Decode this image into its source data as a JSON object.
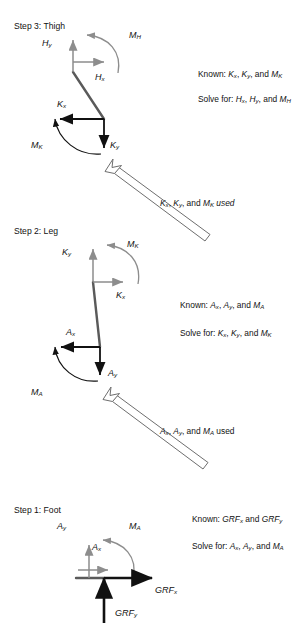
{
  "figure": {
    "title": "Inverse dynamics solution sequence: foot, leg, thigh free-body diagrams",
    "background": "#ffffff",
    "segment_color": "#555555",
    "arrow_dark": "#111111",
    "arrow_gray": "#8d8d8d",
    "hollow_arrow_stroke": "#6e6e6e"
  },
  "steps": [
    {
      "id": "step3",
      "title": "Step 3: Thigh",
      "known_label": "Known:",
      "known_terms": [
        {
          "base": "K",
          "sub": "x"
        },
        {
          "base": "K",
          "sub": "y"
        },
        {
          "base": "M",
          "sub": "K"
        }
      ],
      "known_text": "Known: Kx, Ky, and MK",
      "solve_label": "Solve for:",
      "solve_terms": [
        {
          "base": "H",
          "sub": "x"
        },
        {
          "base": "H",
          "sub": "y"
        },
        {
          "base": "M",
          "sub": "H"
        }
      ],
      "solve_text": "Solve for: Hx, Hy, and MH",
      "vectors": [
        {
          "name": "Hy",
          "base": "H",
          "sub": "y"
        },
        {
          "name": "Hx",
          "base": "H",
          "sub": "x"
        },
        {
          "name": "MH",
          "base": "M",
          "sub": "H"
        },
        {
          "name": "Kx",
          "base": "K",
          "sub": "x"
        },
        {
          "name": "Ky",
          "base": "K",
          "sub": "y"
        },
        {
          "name": "MK",
          "base": "M",
          "sub": "K"
        }
      ]
    },
    {
      "id": "step2",
      "title": "Step 2: Leg",
      "known_label": "Known:",
      "known_terms": [
        {
          "base": "A",
          "sub": "x"
        },
        {
          "base": "A",
          "sub": "y"
        },
        {
          "base": "M",
          "sub": "A"
        }
      ],
      "known_text": "Known: Ax, Ay, and MA",
      "solve_label": "Solve for:",
      "solve_terms": [
        {
          "base": "K",
          "sub": "x"
        },
        {
          "base": "K",
          "sub": "y"
        },
        {
          "base": "M",
          "sub": "K"
        }
      ],
      "solve_text": "Solve for: Kx, Ky, and MK",
      "vectors": [
        {
          "name": "Ky",
          "base": "K",
          "sub": "y"
        },
        {
          "name": "Kx",
          "base": "K",
          "sub": "x"
        },
        {
          "name": "MK",
          "base": "M",
          "sub": "K"
        },
        {
          "name": "Ax",
          "base": "A",
          "sub": "x"
        },
        {
          "name": "Ay",
          "base": "A",
          "sub": "y"
        },
        {
          "name": "MA",
          "base": "M",
          "sub": "A"
        }
      ]
    },
    {
      "id": "step1",
      "title": "Step 1: Foot",
      "known_label": "Known:",
      "known_terms": [
        {
          "base": "GRF",
          "sub": "x"
        },
        {
          "base": "GRF",
          "sub": "y"
        }
      ],
      "known_text": "Known: GRFx and GRFy",
      "solve_label": "Solve for:",
      "solve_terms": [
        {
          "base": "A",
          "sub": "x"
        },
        {
          "base": "A",
          "sub": "y"
        },
        {
          "base": "M",
          "sub": "A"
        }
      ],
      "solve_text": "Solve for: Ax, Ay, and MA",
      "vectors": [
        {
          "name": "Ay",
          "base": "A",
          "sub": "y"
        },
        {
          "name": "Ax",
          "base": "A",
          "sub": "x"
        },
        {
          "name": "MA",
          "base": "M",
          "sub": "A"
        },
        {
          "name": "GRFx",
          "base": "GRF",
          "sub": "x"
        },
        {
          "name": "GRFy",
          "base": "GRF",
          "sub": "y"
        }
      ]
    }
  ],
  "transfers": [
    {
      "id": "transfer-leg-to-thigh",
      "terms": [
        {
          "base": "K",
          "sub": "x"
        },
        {
          "base": "K",
          "sub": "y"
        },
        {
          "base": "M",
          "sub": "K"
        }
      ],
      "suffix": "used",
      "text": "Kx, Ky, and MK used"
    },
    {
      "id": "transfer-foot-to-leg",
      "terms": [
        {
          "base": "A",
          "sub": "x"
        },
        {
          "base": "A",
          "sub": "y"
        },
        {
          "base": "M",
          "sub": "A"
        }
      ],
      "suffix": "used",
      "text": "Ax, Ay, and MA used"
    }
  ],
  "connectors": {
    "and": "and",
    "comma": ","
  }
}
